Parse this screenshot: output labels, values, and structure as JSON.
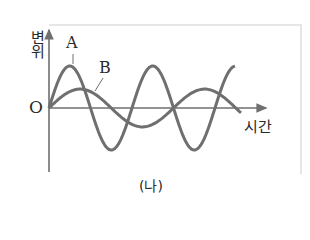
{
  "figure": {
    "caption": "(나)",
    "y_axis_label": "변위",
    "x_axis_label": "시간",
    "origin_label": "O",
    "curve_labels": {
      "a": "A",
      "b": "B"
    }
  },
  "colors": {
    "curve": "#6f6f6f",
    "axis": "#6f6f6f",
    "frame": "#e6e6e6",
    "text": "#2a2a2a"
  },
  "chart_data": {
    "type": "line",
    "title": "",
    "xlabel": "시간",
    "ylabel": "변위",
    "grid": false,
    "legend": "inline labels",
    "series": [
      {
        "name": "A",
        "kind": "sine",
        "amplitude_rel": 1.0,
        "period_rel": 1.0,
        "phase": 0,
        "cycles_shown": 2.25
      },
      {
        "name": "B",
        "kind": "sine",
        "amplitude_rel": 0.45,
        "period_rel": 1.5,
        "phase": 0,
        "cycles_shown": 1.55
      }
    ]
  }
}
